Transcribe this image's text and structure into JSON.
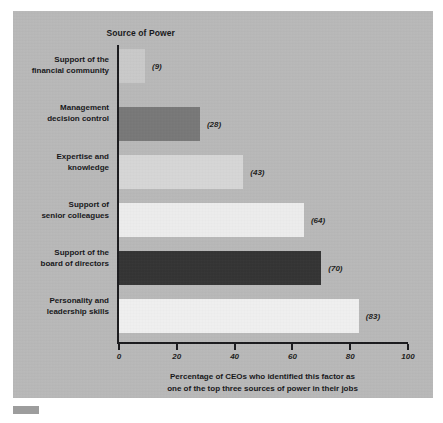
{
  "figure": {
    "title": "Source of Power",
    "background_color": "#b8b8b8",
    "axis_color": "#1b1b1e",
    "corner_marker_color": "#9d9d9d"
  },
  "chart_data": {
    "type": "bar",
    "orientation": "horizontal",
    "title": "Source of Power",
    "xlabel": "Percentage of CEOs who identified this factor as one of the top three sources of power in their jobs",
    "ylabel": "Source of Power",
    "xlim": [
      0,
      100
    ],
    "grid": false,
    "legend": "none",
    "categories": [
      "Support of the financial community",
      "Management decision control",
      "Expertise and knowledge",
      "Support of senior colleagues",
      "Support of the board of directors",
      "Personality and leadership skills"
    ],
    "values": [
      9,
      28,
      43,
      64,
      70,
      83
    ],
    "value_labels": [
      "(9)",
      "(28)",
      "(43)",
      "(64)",
      "(70)",
      "(83)"
    ],
    "bar_colors": [
      "#c9c9c9",
      "#787878",
      "#d6d6d6",
      "#ececec",
      "#343434",
      "#efefef"
    ],
    "xticks": [
      0,
      20,
      40,
      60,
      80,
      100
    ],
    "xtick_labels": [
      "0",
      "20",
      "40",
      "60",
      "80",
      "100"
    ]
  },
  "category_lines": [
    [
      "Support of the",
      "financial community"
    ],
    [
      "Management",
      "decision control"
    ],
    [
      "Expertise and",
      "knowledge"
    ],
    [
      "Support of",
      "senior colleagues"
    ],
    [
      "Support of the",
      "board of directors"
    ],
    [
      "Personality and",
      "leadership skills"
    ]
  ],
  "caption": {
    "line1": "Percentage of CEOs who identified this factor as",
    "line2": "one of the top three sources of power in their jobs"
  }
}
